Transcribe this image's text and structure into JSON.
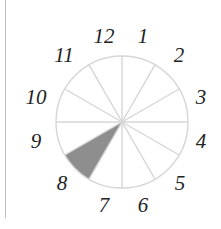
{
  "diagram": {
    "type": "clock-sector-dial",
    "center": [
      122,
      122
    ],
    "radius": 66,
    "sector_count": 12,
    "labels": [
      "12",
      "1",
      "2",
      "3",
      "4",
      "5",
      "6",
      "7",
      "8",
      "9",
      "10",
      "11"
    ],
    "shaded_sector": "8",
    "colors": {
      "outline": "#d6d6d6",
      "spoke": "#d6d6d6",
      "shade": "#8e8e8e",
      "label": "#222222",
      "frame_line": "#bdbdbd"
    }
  }
}
